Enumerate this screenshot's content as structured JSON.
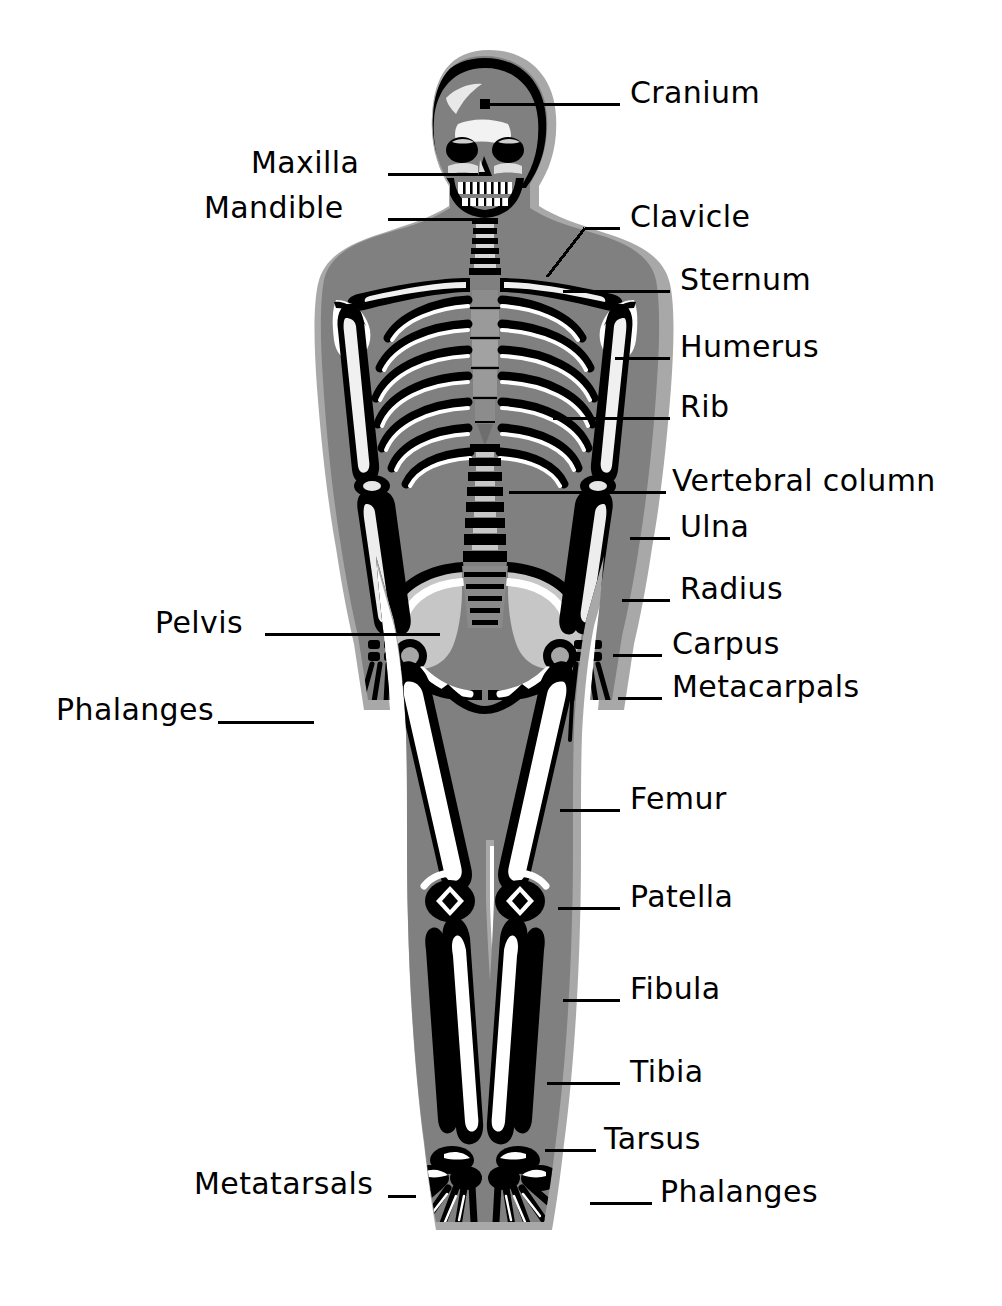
{
  "diagram": {
    "background_color": "#ffffff",
    "text_color": "#000000",
    "leader_line_color": "#000000",
    "body_silhouette_color": "#808080",
    "body_shadow_color": "#a8a8a8",
    "bone_dark_color": "#000000",
    "bone_light_color": "#ffffff",
    "bone_mid_color": "#6e6e6e"
  },
  "labels": [
    {
      "id": "cranium",
      "text": "Cranium",
      "side": "right",
      "x": 630,
      "y": 78,
      "line": {
        "x1": 562,
        "y1": 104,
        "x2": 620,
        "y2": 104
      },
      "dot": {
        "x": 485,
        "y": 104
      },
      "dot_line": {
        "x1": 485,
        "y1": 104,
        "x2": 562,
        "y2": 104
      }
    },
    {
      "id": "maxilla",
      "text": "Maxilla",
      "side": "left",
      "x": 251,
      "y": 148,
      "line": {
        "x1": 388,
        "y1": 174,
        "x2": 478,
        "y2": 174
      }
    },
    {
      "id": "mandible",
      "text": "Mandible",
      "side": "left",
      "x": 204,
      "y": 193,
      "line": {
        "x1": 388,
        "y1": 219,
        "x2": 480,
        "y2": 219
      }
    },
    {
      "id": "clavicle",
      "text": "Clavicle",
      "side": "right",
      "x": 630,
      "y": 202,
      "line": {
        "x1": 585,
        "y1": 228,
        "x2": 620,
        "y2": 228
      },
      "elbow": {
        "x": 547,
        "y": 277
      }
    },
    {
      "id": "sternum",
      "text": "Sternum",
      "side": "right",
      "x": 680,
      "y": 265,
      "line": {
        "x1": 563,
        "y1": 291,
        "x2": 670,
        "y2": 291
      }
    },
    {
      "id": "humerus",
      "text": "Humerus",
      "side": "right",
      "x": 680,
      "y": 332,
      "line": {
        "x1": 615,
        "y1": 358,
        "x2": 670,
        "y2": 358
      }
    },
    {
      "id": "rib",
      "text": "Rib",
      "side": "right",
      "x": 680,
      "y": 392,
      "line": {
        "x1": 553,
        "y1": 418,
        "x2": 670,
        "y2": 418
      }
    },
    {
      "id": "vertebral-column",
      "text": "Vertebral column",
      "side": "right",
      "x": 672,
      "y": 466,
      "line": {
        "x1": 509,
        "y1": 492,
        "x2": 666,
        "y2": 492
      }
    },
    {
      "id": "ulna",
      "text": "Ulna",
      "side": "right",
      "x": 680,
      "y": 512,
      "line": {
        "x1": 630,
        "y1": 538,
        "x2": 670,
        "y2": 538
      }
    },
    {
      "id": "radius",
      "text": "Radius",
      "side": "right",
      "x": 680,
      "y": 574,
      "line": {
        "x1": 622,
        "y1": 600,
        "x2": 670,
        "y2": 600
      }
    },
    {
      "id": "carpus",
      "text": "Carpus",
      "side": "right",
      "x": 672,
      "y": 629,
      "line": {
        "x1": 613,
        "y1": 655,
        "x2": 662,
        "y2": 655
      }
    },
    {
      "id": "metacarpals",
      "text": "Metacarpals",
      "side": "right",
      "x": 672,
      "y": 672,
      "line": {
        "x1": 618,
        "y1": 698,
        "x2": 662,
        "y2": 698
      }
    },
    {
      "id": "pelvis",
      "text": "Pelvis",
      "side": "left",
      "x": 155,
      "y": 608,
      "line": {
        "x1": 265,
        "y1": 634,
        "x2": 440,
        "y2": 634
      }
    },
    {
      "id": "phalanges-hand",
      "text": "Phalanges",
      "side": "left",
      "x": 56,
      "y": 695,
      "line": {
        "x1": 218,
        "y1": 722,
        "x2": 314,
        "y2": 722
      }
    },
    {
      "id": "femur",
      "text": "Femur",
      "side": "right",
      "x": 630,
      "y": 784,
      "line": {
        "x1": 560,
        "y1": 810,
        "x2": 620,
        "y2": 810
      }
    },
    {
      "id": "patella",
      "text": "Patella",
      "side": "right",
      "x": 630,
      "y": 882,
      "line": {
        "x1": 558,
        "y1": 908,
        "x2": 620,
        "y2": 908
      }
    },
    {
      "id": "fibula",
      "text": "Fibula",
      "side": "right",
      "x": 630,
      "y": 974,
      "line": {
        "x1": 563,
        "y1": 1000,
        "x2": 620,
        "y2": 1000
      }
    },
    {
      "id": "tibia",
      "text": "Tibia",
      "side": "right",
      "x": 630,
      "y": 1057,
      "line": {
        "x1": 547,
        "y1": 1083,
        "x2": 620,
        "y2": 1083
      }
    },
    {
      "id": "tarsus",
      "text": "Tarsus",
      "side": "right",
      "x": 604,
      "y": 1124,
      "line": {
        "x1": 545,
        "y1": 1150,
        "x2": 596,
        "y2": 1150
      }
    },
    {
      "id": "metatarsals",
      "text": "Metatarsals",
      "side": "left",
      "x": 194,
      "y": 1169,
      "line": {
        "x1": 388,
        "y1": 1196,
        "x2": 416,
        "y2": 1196
      }
    },
    {
      "id": "phalanges-foot",
      "text": "Phalanges",
      "side": "right",
      "x": 660,
      "y": 1177,
      "line": {
        "x1": 590,
        "y1": 1203,
        "x2": 652,
        "y2": 1203
      }
    }
  ]
}
